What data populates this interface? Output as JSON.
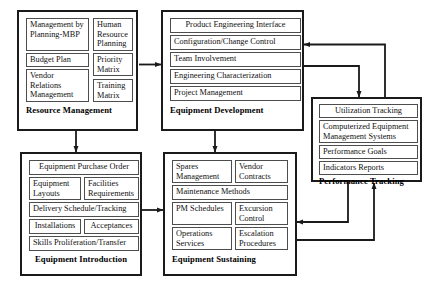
{
  "diagram": {
    "line_color": "#1a1a1a",
    "box_border_color": "#1a1a1a",
    "cell_border_color": "#4d4d4d",
    "background": "#ffffff"
  },
  "groups": {
    "resource_management": {
      "label": "Resource Management",
      "cells": [
        {
          "text": "Management by Planning-MBP"
        },
        {
          "text": "Human Resource Planning"
        },
        {
          "text": "Budget Plan"
        },
        {
          "text": "Priority Matrix"
        },
        {
          "text": "Vendor Relations Management"
        },
        {
          "text": "Training Matrix"
        }
      ]
    },
    "equipment_development": {
      "label": "Equipment Development",
      "cells": [
        {
          "text": "Product Engineering Interface"
        },
        {
          "text": "Configuration/Change Control"
        },
        {
          "text": "Team Involvement"
        },
        {
          "text": "Engineering Characterization"
        },
        {
          "text": "Project Management"
        }
      ]
    },
    "performance_tracking": {
      "label": "Performance Tracking",
      "cells": [
        {
          "text": "Utilization Tracking"
        },
        {
          "text": "Computerized Equipment Management Systems"
        },
        {
          "text": "Performance Goals"
        },
        {
          "text": "Indicators Reports"
        }
      ]
    },
    "equipment_introduction": {
      "label": "Equipment Introduction",
      "cells": [
        {
          "text": "Equipment Purchase Order"
        },
        {
          "text": "Equipment Layouts"
        },
        {
          "text": "Facilities Requirements"
        },
        {
          "text": "Delivery Schedule/Tracking"
        },
        {
          "text": "Installations"
        },
        {
          "text": "Acceptances"
        },
        {
          "text": "Skills Proliferation/Transfer"
        }
      ]
    },
    "equipment_sustaining": {
      "label": "Equipment Sustaining",
      "cells": [
        {
          "text": "Spares Management"
        },
        {
          "text": "Vendor Contracts"
        },
        {
          "text": "Maintenance Methods"
        },
        {
          "text": "PM Schedules"
        },
        {
          "text": "Excursion Control"
        },
        {
          "text": "Operations Services"
        },
        {
          "text": "Escalation Procedures"
        }
      ]
    }
  },
  "connectors": [
    {
      "name": "resource-management-to-equipment-development",
      "from": "Resource Management",
      "to": "Equipment Development"
    },
    {
      "name": "resource-management-to-equipment-introduction",
      "from": "Resource Management",
      "to": "Equipment Introduction"
    },
    {
      "name": "equipment-development-to-equipment-sustaining",
      "from": "Equipment Development",
      "to": "Equipment Sustaining"
    },
    {
      "name": "equipment-development-to-performance-tracking",
      "from": "Equipment Development",
      "to": "Performance Tracking"
    },
    {
      "name": "performance-tracking-to-equipment-development",
      "from": "Performance Tracking",
      "to": "Equipment Development"
    },
    {
      "name": "performance-tracking-to-equipment-sustaining",
      "from": "Performance Tracking",
      "to": "Equipment Sustaining"
    },
    {
      "name": "equipment-sustaining-to-performance-tracking",
      "from": "Equipment Sustaining",
      "to": "Performance Tracking"
    },
    {
      "name": "equipment-introduction-to-equipment-sustaining",
      "from": "Equipment Introduction",
      "to": "Equipment Sustaining"
    }
  ]
}
